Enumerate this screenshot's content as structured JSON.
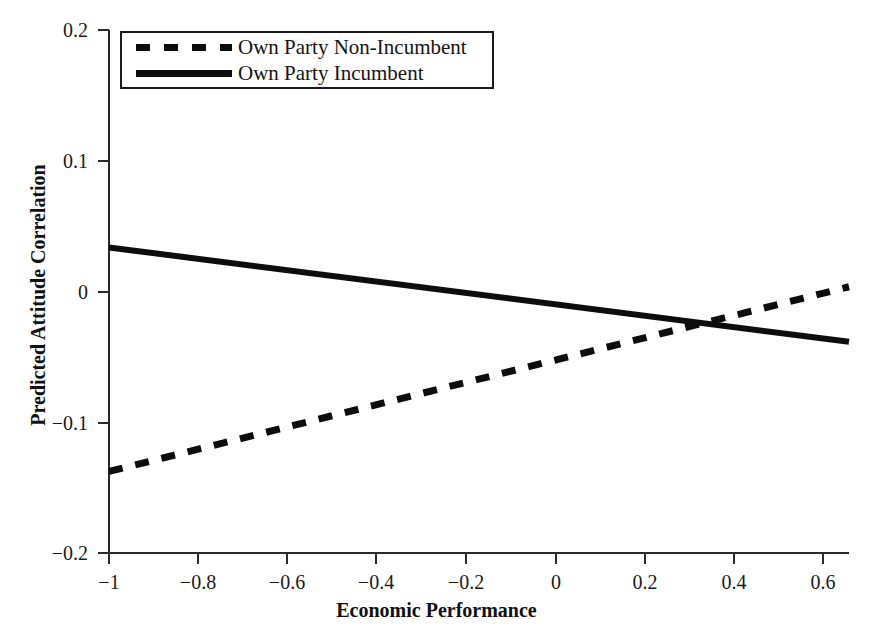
{
  "chart_data": {
    "type": "line",
    "title": "",
    "xlabel": "Economic Performance",
    "ylabel": "Predicted Attitude Correlation",
    "xlim": [
      -1.0,
      0.655
    ],
    "ylim": [
      -0.2,
      0.2
    ],
    "grid": false,
    "legend_position": "top-left",
    "x_ticks": [
      -1,
      -0.8,
      -0.6,
      -0.4,
      -0.2,
      0,
      0.2,
      0.4,
      0.6
    ],
    "x_tick_labels": [
      "−1",
      "−0.8",
      "−0.6",
      "−0.4",
      "−0.2",
      "0",
      "0.2",
      "0.4",
      "0.6"
    ],
    "y_ticks": [
      -0.2,
      -0.1,
      0,
      0.1,
      0.2
    ],
    "y_tick_labels": [
      "−0.2",
      "−0.1",
      "0",
      "0.1",
      "0.2"
    ],
    "series": [
      {
        "name": "Own Party Non-Incumbent",
        "style": "dashed",
        "color": "#0d0d0d",
        "x": [
          -1.0,
          0.655
        ],
        "values": [
          -0.137,
          0.004
        ]
      },
      {
        "name": "Own Party Incumbent",
        "style": "solid",
        "color": "#0d0d0d",
        "x": [
          -1.0,
          0.655
        ],
        "values": [
          0.034,
          -0.038
        ]
      }
    ],
    "annotations": [
      {
        "name": "series-crossing",
        "x": 0.34,
        "y": -0.024
      }
    ]
  },
  "legend": {
    "entries": [
      {
        "label": "Own Party Non-Incumbent",
        "swatch": "dashed-line-swatch"
      },
      {
        "label": "Own Party Incumbent",
        "swatch": "solid-line-swatch"
      }
    ]
  },
  "axes": {
    "x_title": "Economic Performance",
    "y_title": "Predicted Attitude Correlation"
  },
  "ticks": {
    "y": [
      {
        "label": "0.2",
        "px": 30
      },
      {
        "label": "0.1",
        "px": 161
      },
      {
        "label": "0",
        "px": 292
      },
      {
        "label": "−0.1",
        "px": 423
      },
      {
        "label": "−0.2",
        "px": 553
      }
    ],
    "x": [
      {
        "label": "−1",
        "px": 109
      },
      {
        "label": "−0.8",
        "px": 198
      },
      {
        "label": "−0.6",
        "px": 287
      },
      {
        "label": "−0.4",
        "px": 376
      },
      {
        "label": "−0.2",
        "px": 466
      },
      {
        "label": "0",
        "px": 556
      },
      {
        "label": "0.2",
        "px": 645
      },
      {
        "label": "0.4",
        "px": 734
      },
      {
        "label": "0.6",
        "px": 823
      }
    ]
  }
}
